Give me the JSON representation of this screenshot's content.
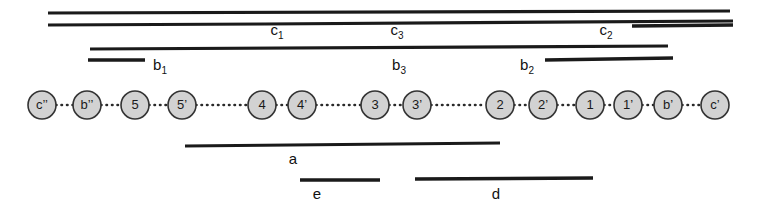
{
  "figure": {
    "title": "",
    "background_color": "#ffffff",
    "line_color": "#1a1a1a",
    "node_fill_color": "#d2d2d2",
    "node_stroke_color": "#333333",
    "width": 762,
    "height": 216
  },
  "nodes": [
    {
      "id": "n1",
      "label": "c’’",
      "cx": 42,
      "cy": 105,
      "r": 14
    },
    {
      "id": "n2",
      "label": "b’’",
      "cx": 87,
      "cy": 105,
      "r": 14
    },
    {
      "id": "n3",
      "label": "5",
      "cx": 135,
      "cy": 105,
      "r": 14
    },
    {
      "id": "n4",
      "label": "5’",
      "cx": 182,
      "cy": 105,
      "r": 14
    },
    {
      "id": "n5",
      "label": "4",
      "cx": 262,
      "cy": 105,
      "r": 14
    },
    {
      "id": "n6",
      "label": "4’",
      "cx": 302,
      "cy": 105,
      "r": 14
    },
    {
      "id": "n7",
      "label": "3",
      "cx": 375,
      "cy": 105,
      "r": 14
    },
    {
      "id": "n8",
      "label": "3’",
      "cx": 417,
      "cy": 105,
      "r": 14
    },
    {
      "id": "n9",
      "label": "2",
      "cx": 500,
      "cy": 105,
      "r": 14
    },
    {
      "id": "n10",
      "label": "2’",
      "cx": 543,
      "cy": 105,
      "r": 14
    },
    {
      "id": "n11",
      "label": "1",
      "cx": 590,
      "cy": 105,
      "r": 14
    },
    {
      "id": "n12",
      "label": "1’",
      "cx": 628,
      "cy": 105,
      "r": 14
    },
    {
      "id": "n13",
      "label": "b’",
      "cx": 668,
      "cy": 105,
      "r": 14
    },
    {
      "id": "n14",
      "label": "c’",
      "cx": 715,
      "cy": 105,
      "r": 14
    }
  ],
  "segments": [
    {
      "name": "c3",
      "label_base": "c",
      "label_sub": "3",
      "x1": 48,
      "y1": 13,
      "x2": 730,
      "y2": 11,
      "thickness": 3.2,
      "label_x": 397,
      "label_y": 35
    },
    {
      "name": "c1",
      "label_base": "c",
      "label_sub": "1",
      "x1": 48,
      "y1": 25,
      "x2": 265,
      "y2": 24,
      "thickness": 3.2,
      "label_x": 277,
      "label_y": 35
    },
    {
      "name": "c2-long",
      "label_base": "",
      "label_sub": "",
      "x1": 265,
      "y1": 24,
      "x2": 733,
      "y2": 21,
      "thickness": 3.2,
      "label_x": 0,
      "label_y": 0
    },
    {
      "name": "c2",
      "label_base": "c",
      "label_sub": "2",
      "x1": 632,
      "y1": 26,
      "x2": 733,
      "y2": 25,
      "thickness": 3.4,
      "label_x": 606,
      "label_y": 35
    },
    {
      "name": "b3",
      "label_base": "b",
      "label_sub": "3",
      "x1": 90,
      "y1": 49,
      "x2": 668,
      "y2": 46,
      "thickness": 3.2,
      "label_x": 399,
      "label_y": 70
    },
    {
      "name": "b1",
      "label_base": "b",
      "label_sub": "1",
      "x1": 88,
      "y1": 60,
      "x2": 145,
      "y2": 60,
      "thickness": 3.4,
      "label_x": 160,
      "label_y": 70
    },
    {
      "name": "b2",
      "label_base": "b",
      "label_sub": "2",
      "x1": 545,
      "y1": 60,
      "x2": 673,
      "y2": 58,
      "thickness": 3.4,
      "label_x": 527,
      "label_y": 70
    },
    {
      "name": "a",
      "label_base": "a",
      "label_sub": "",
      "x1": 185,
      "y1": 146,
      "x2": 500,
      "y2": 143,
      "thickness": 3.2,
      "label_x": 293,
      "label_y": 164
    },
    {
      "name": "e",
      "label_base": "e",
      "label_sub": "",
      "x1": 300,
      "y1": 180,
      "x2": 380,
      "y2": 180,
      "thickness": 3.4,
      "label_x": 317,
      "label_y": 199
    },
    {
      "name": "d",
      "label_base": "d",
      "label_sub": "",
      "x1": 415,
      "y1": 179,
      "x2": 593,
      "y2": 178,
      "thickness": 3.4,
      "label_x": 496,
      "label_y": 199
    }
  ],
  "connectors": [
    {
      "from_x": 56,
      "to_x": 73,
      "y": 105
    },
    {
      "from_x": 101,
      "to_x": 121,
      "y": 105
    },
    {
      "from_x": 149,
      "to_x": 168,
      "y": 105
    },
    {
      "from_x": 196,
      "to_x": 248,
      "y": 105
    },
    {
      "from_x": 276,
      "to_x": 288,
      "y": 105
    },
    {
      "from_x": 316,
      "to_x": 361,
      "y": 105
    },
    {
      "from_x": 389,
      "to_x": 403,
      "y": 105
    },
    {
      "from_x": 431,
      "to_x": 486,
      "y": 105
    },
    {
      "from_x": 514,
      "to_x": 529,
      "y": 105
    },
    {
      "from_x": 557,
      "to_x": 576,
      "y": 105
    },
    {
      "from_x": 604,
      "to_x": 614,
      "y": 105
    },
    {
      "from_x": 642,
      "to_x": 654,
      "y": 105
    },
    {
      "from_x": 682,
      "to_x": 701,
      "y": 105
    }
  ]
}
